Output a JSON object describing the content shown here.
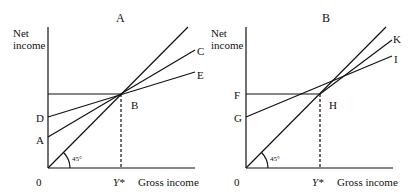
{
  "panels": [
    {
      "title": "A",
      "y_axis_label_line1": "Net",
      "y_axis_label_line2": "income",
      "x_axis_label": "Gross income",
      "origin_label": "0",
      "ystar_label": "Y*",
      "angle_label": "45°",
      "intersection_label": "B",
      "intercept_labels": [
        "D",
        "A"
      ],
      "line_labels": [
        "C",
        "E"
      ]
    },
    {
      "title": "B",
      "y_axis_label_line1": "Net",
      "y_axis_label_line2": "income",
      "x_axis_label": "Gross income",
      "origin_label": "0",
      "ystar_label": "Y*",
      "angle_label": "45°",
      "intersection_label": "H",
      "intercept_labels": [
        "F",
        "G"
      ],
      "line_labels": [
        "K",
        "I"
      ]
    }
  ]
}
